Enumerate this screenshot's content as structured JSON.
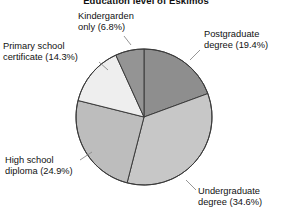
{
  "chart_data": {
    "type": "pie",
    "title": "Education level of Eskimos",
    "xlabel": "",
    "ylabel": "",
    "legend_position": "none",
    "grid": false,
    "start_angle_deg": 90,
    "direction": "clockwise",
    "categories": [
      "Postgraduate degree",
      "Undergraduate degree",
      "High school diploma",
      "Primary school certificate",
      "Kindergarden only"
    ],
    "values": [
      19.4,
      34.6,
      24.9,
      14.3,
      6.8
    ],
    "units": "%",
    "slices": [
      {
        "name": "Postgraduate degree",
        "value": 19.4,
        "percent_text": "(19.4%)",
        "color": "#8e8e8e",
        "label_line1": "Postgraduate",
        "label_line2": "degree (19.4%)"
      },
      {
        "name": "Undergraduate degree",
        "value": 34.6,
        "percent_text": "(34.6%)",
        "color": "#c7c7c7",
        "label_line1": "Undergraduate",
        "label_line2": "degree (34.6%)"
      },
      {
        "name": "High school diploma",
        "value": 24.9,
        "percent_text": "(24.9%)",
        "color": "#bdbdbd",
        "label_line1": "High school",
        "label_line2": "diploma (24.9%)"
      },
      {
        "name": "Primary school certificate",
        "value": 14.3,
        "percent_text": "(14.3%)",
        "color": "#eeeeee",
        "label_line1": "Primary school",
        "label_line2": "certificate (14.3%)"
      },
      {
        "name": "Kindergarden only",
        "value": 6.8,
        "percent_text": "(6.8%)",
        "color": "#949494",
        "label_line1": "Kindergarden",
        "label_line2": "only (6.8%)"
      }
    ],
    "outline_color": "#3b3b3b"
  }
}
